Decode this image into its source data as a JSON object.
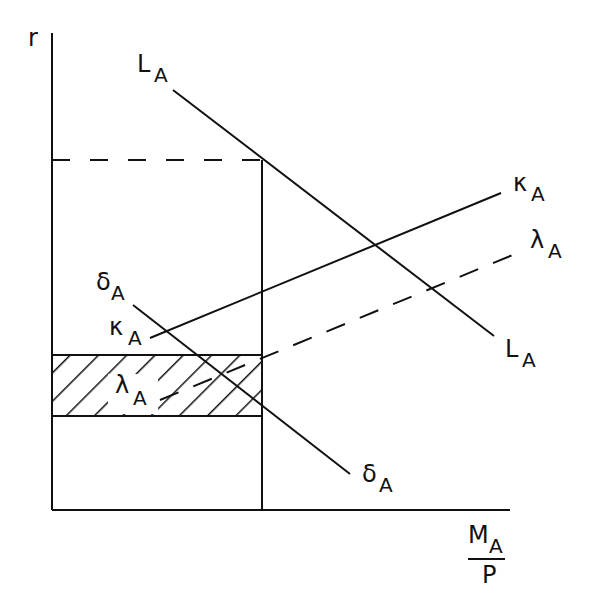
{
  "diagram": {
    "type": "economic-diagram",
    "colors": {
      "ink": "#111111",
      "background": "#ffffff"
    },
    "axes": {
      "y_label": "r",
      "x_label": {
        "numerator": "M",
        "numerator_sub": "A",
        "denominator": "P"
      }
    },
    "curves": [
      {
        "id": "L",
        "label": "L",
        "sub": "A",
        "style": "solid",
        "slope": "downward"
      },
      {
        "id": "kappa",
        "label": "κ",
        "sub": "A",
        "style": "solid",
        "slope": "upward"
      },
      {
        "id": "lambda",
        "label": "λ",
        "sub": "A",
        "style": "dashed",
        "slope": "upward"
      },
      {
        "id": "delta",
        "label": "δ",
        "sub": "A",
        "style": "solid",
        "slope": "downward"
      }
    ],
    "labels": {
      "L_top": {
        "main": "L",
        "sub": "A"
      },
      "L_bottom": {
        "main": "L",
        "sub": "A"
      },
      "kappa_right": {
        "main": "κ",
        "sub": "A"
      },
      "kappa_left": {
        "main": "κ",
        "sub": "A"
      },
      "lambda_right": {
        "main": "λ",
        "sub": "A"
      },
      "lambda_left": {
        "main": "λ",
        "sub": "A"
      },
      "delta_top": {
        "main": "δ",
        "sub": "A"
      },
      "delta_bottom": {
        "main": "δ",
        "sub": "A"
      }
    },
    "shaded_region": {
      "description": "hatched band between two interest rates",
      "pattern": "diagonal-hatch"
    }
  }
}
